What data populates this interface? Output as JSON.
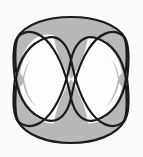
{
  "figure": {
    "type": "knot-diagram",
    "width": 143,
    "height": 157,
    "background_color": "#fafafa",
    "fill_color": "#b8b8b8",
    "empty_color": "#fdfdfd",
    "stroke_color": "#1a1a1a",
    "stroke_width": 2.2,
    "geometry": {
      "center_crossing": {
        "x": 71,
        "y": 79
      },
      "left_pinch": {
        "x": 16,
        "y": 79
      },
      "right_pinch": {
        "x": 127,
        "y": 79
      },
      "top_apex": {
        "x": 71,
        "y": 18
      },
      "bottom_apex": {
        "x": 71,
        "y": 142
      },
      "outer_left": 14,
      "outer_right": 129,
      "outer_top": 17,
      "outer_bottom": 143
    },
    "regions": [
      {
        "name": "upper-left-lune",
        "fill": "#b8b8b8"
      },
      {
        "name": "upper-right-lune",
        "fill": "#b8b8b8"
      },
      {
        "name": "lower-left-lune",
        "fill": "#b8b8b8"
      },
      {
        "name": "lower-right-lune",
        "fill": "#b8b8b8"
      },
      {
        "name": "top-centre-wedge",
        "fill": "#b8b8b8"
      },
      {
        "name": "bottom-centre-wedge",
        "fill": "#b8b8b8"
      },
      {
        "name": "left-eye",
        "fill": "#fdfdfd"
      },
      {
        "name": "right-eye",
        "fill": "#fdfdfd"
      },
      {
        "name": "upper-centre-gap",
        "fill": "#fdfdfd"
      },
      {
        "name": "lower-centre-gap",
        "fill": "#fdfdfd"
      }
    ]
  }
}
